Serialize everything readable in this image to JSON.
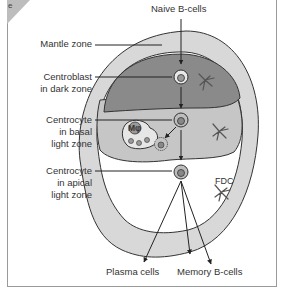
{
  "panel": {
    "tag": "e"
  },
  "labels": {
    "naive_b_cells": "Naive B-cells",
    "mantle_zone": "Mantle zone",
    "centroblast_l1": "Centroblast",
    "centroblast_l2": "in dark zone",
    "centrocyte_basal_l1": "Centrocyte",
    "centrocyte_basal_l2": "in basal",
    "centrocyte_basal_l3": "light zone",
    "centrocyte_apical_l1": "Centrocyte",
    "centrocyte_apical_l2": "in apical",
    "centrocyte_apical_l3": "light zone",
    "macrophage": "Mφ",
    "fdc": "FDC",
    "plasma_cells": "Plasma cells",
    "memory_b_cells": "Memory B-cells"
  },
  "colors": {
    "mantle_zone": "#d6d6d6",
    "dark_zone": "#8c8c8c",
    "basal_light_zone": "#c4c4c4",
    "apical_light_zone": "#ffffff",
    "outline": "#333333"
  }
}
